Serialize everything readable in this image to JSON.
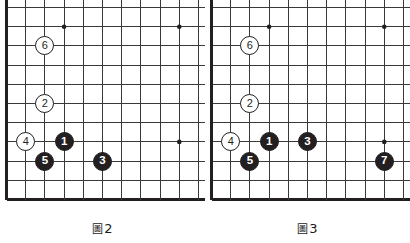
{
  "figure": {
    "type": "go-board-diagrams",
    "count": 2,
    "board_style": {
      "black_stone_color": "#231f20",
      "white_stone_color": "#ffffff",
      "line_color": "#3a3a3a",
      "edge_color": "#231f20",
      "background": "#ffffff"
    }
  },
  "diagrams": [
    {
      "id": "figure-2",
      "caption_char": "圖",
      "caption_number": "2",
      "caption_full": "圖2",
      "grid": {
        "cols": 11,
        "rows": 11
      },
      "star_points": [
        {
          "col": 3,
          "row": 1
        },
        {
          "col": 9,
          "row": 1
        },
        {
          "col": 9,
          "row": 7
        }
      ],
      "stones": [
        {
          "label": "1",
          "color": "black",
          "col": 3,
          "row": 7
        },
        {
          "label": "2",
          "color": "white",
          "col": 2,
          "row": 5
        },
        {
          "label": "3",
          "color": "black",
          "col": 5,
          "row": 8
        },
        {
          "label": "4",
          "color": "white",
          "col": 1,
          "row": 7
        },
        {
          "label": "5",
          "color": "black",
          "col": 2,
          "row": 8
        },
        {
          "label": "6",
          "color": "white",
          "col": 2,
          "row": 2
        }
      ]
    },
    {
      "id": "figure-3",
      "caption_char": "圖",
      "caption_number": "3",
      "caption_full": "圖3",
      "grid": {
        "cols": 11,
        "rows": 11
      },
      "star_points": [
        {
          "col": 3,
          "row": 1
        },
        {
          "col": 9,
          "row": 1
        },
        {
          "col": 9,
          "row": 7
        }
      ],
      "stones": [
        {
          "label": "1",
          "color": "black",
          "col": 3,
          "row": 7
        },
        {
          "label": "2",
          "color": "white",
          "col": 2,
          "row": 5
        },
        {
          "label": "3",
          "color": "black",
          "col": 5,
          "row": 7
        },
        {
          "label": "4",
          "color": "white",
          "col": 1,
          "row": 7
        },
        {
          "label": "5",
          "color": "black",
          "col": 2,
          "row": 8
        },
        {
          "label": "6",
          "color": "white",
          "col": 2,
          "row": 2
        },
        {
          "label": "7",
          "color": "black",
          "col": 9,
          "row": 8
        }
      ]
    }
  ]
}
